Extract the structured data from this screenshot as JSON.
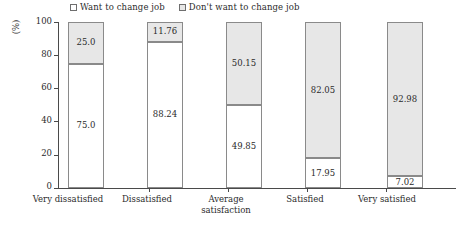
{
  "chart_data": {
    "type": "bar",
    "subtype": "stacked-100-percent",
    "title": "",
    "xlabel": "",
    "ylabel": "(%)",
    "ylim": [
      0,
      100
    ],
    "yticks": [
      0,
      20,
      40,
      60,
      80,
      100
    ],
    "grid": false,
    "legend_position": "top",
    "categories": [
      "Very dissatisfied",
      "Dissatisfied",
      "Average satisfaction",
      "Satisfied",
      "Very satisfied"
    ],
    "series": [
      {
        "name": "Want to change job",
        "color": "#ffffff",
        "values": [
          75.0,
          88.24,
          49.85,
          17.95,
          7.02
        ],
        "labels": [
          "75.0",
          "88.24",
          "49.85",
          "17.95",
          "7.02"
        ]
      },
      {
        "name": "Don't want to change job",
        "color": "#e7e7e7",
        "values": [
          25.0,
          11.76,
          50.15,
          82.05,
          92.98
        ],
        "labels": [
          "25.0",
          "11.76",
          "50.15",
          "82.05",
          "92.98"
        ]
      }
    ]
  },
  "legend": {
    "items": [
      {
        "label": "Want to change job",
        "swatch": "white"
      },
      {
        "label": "Don't want to change job",
        "swatch": "gray"
      }
    ]
  },
  "axis": {
    "y_unit_label": "(%)",
    "y_tick_labels": [
      "100",
      "80",
      "60",
      "40",
      "20",
      "0"
    ]
  },
  "categories_display": [
    {
      "line1": "Very dissatisfied",
      "line2": ""
    },
    {
      "line1": "Dissatisfied",
      "line2": ""
    },
    {
      "line1": "Average",
      "line2": "satisfaction"
    },
    {
      "line1": "Satisfied",
      "line2": ""
    },
    {
      "line1": "Very satisfied",
      "line2": ""
    }
  ]
}
